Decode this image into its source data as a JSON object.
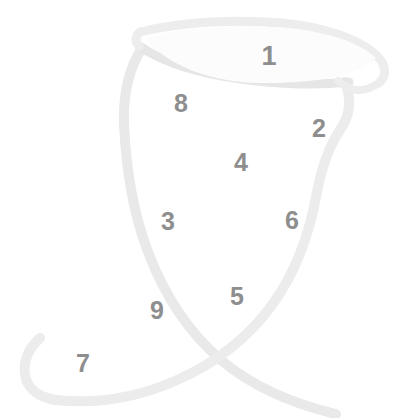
{
  "figure": {
    "background_color": "#ffffff",
    "outline_color": "#e9e9e9",
    "outline_color_soft": "#f0f0f0",
    "marker_color": "#8e8e8e",
    "marker_font_size_px": 25,
    "stroke_width_px": 9
  },
  "markers": [
    {
      "label": "1",
      "x": 269,
      "y": 56,
      "size": 27
    },
    {
      "label": "8",
      "x": 181,
      "y": 103,
      "size": 25
    },
    {
      "label": "2",
      "x": 319,
      "y": 128,
      "size": 25
    },
    {
      "label": "4",
      "x": 241,
      "y": 162,
      "size": 25
    },
    {
      "label": "3",
      "x": 168,
      "y": 221,
      "size": 25
    },
    {
      "label": "6",
      "x": 292,
      "y": 220,
      "size": 25
    },
    {
      "label": "5",
      "x": 237,
      "y": 296,
      "size": 25
    },
    {
      "label": "9",
      "x": 157,
      "y": 310,
      "size": 25
    },
    {
      "label": "7",
      "x": 83,
      "y": 363,
      "size": 25
    }
  ]
}
